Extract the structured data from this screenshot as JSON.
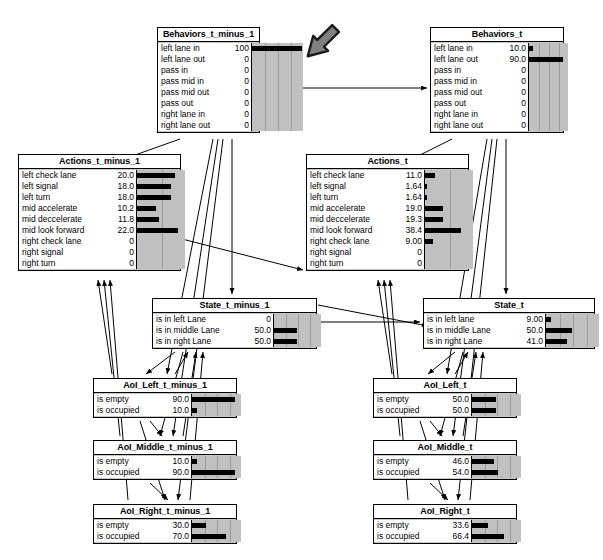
{
  "diagram": {
    "background": "#ffffff",
    "node_fill": "#ffffff",
    "bar_background": "#c0c0c0",
    "bar_color": "#000000",
    "edge_color": "#000000",
    "annotation_arrow_color": "#808080"
  },
  "nodes": [
    {
      "id": "behaviors_t_minus_1",
      "title": "Behaviors_t_minus_1",
      "x": 157,
      "y": 27,
      "w": 103,
      "h": 110,
      "label_w": 66,
      "value_w": 22,
      "bar_w": 52,
      "bar_max": 100,
      "grid_divisions": 4,
      "rows": [
        {
          "label": "left lane in",
          "value": "100",
          "pct": 100
        },
        {
          "label": "left lane out",
          "value": "0",
          "pct": 0
        },
        {
          "label": "pass in",
          "value": "0",
          "pct": 0
        },
        {
          "label": "pass mid in",
          "value": "0",
          "pct": 0
        },
        {
          "label": "pass mid out",
          "value": "0",
          "pct": 0
        },
        {
          "label": "pass out",
          "value": "0",
          "pct": 0
        },
        {
          "label": "right lane in",
          "value": "0",
          "pct": 0
        },
        {
          "label": "right lane out",
          "value": "0",
          "pct": 0
        }
      ]
    },
    {
      "id": "behaviors_t",
      "title": "Behaviors_t",
      "x": 430,
      "y": 27,
      "w": 134,
      "h": 110,
      "label_w": 66,
      "value_w": 26,
      "bar_w": 40,
      "bar_max": 100,
      "grid_divisions": 4,
      "rows": [
        {
          "label": "left lane in",
          "value": "10.0",
          "pct": 10
        },
        {
          "label": "left lane out",
          "value": "90.0",
          "pct": 90
        },
        {
          "label": "pass in",
          "value": "0",
          "pct": 0
        },
        {
          "label": "pass mid in",
          "value": "0",
          "pct": 0
        },
        {
          "label": "pass mid out",
          "value": "0",
          "pct": 0
        },
        {
          "label": "pass out",
          "value": "0",
          "pct": 0
        },
        {
          "label": "right lane in",
          "value": "0",
          "pct": 0
        },
        {
          "label": "right lane out",
          "value": "0",
          "pct": 0
        }
      ]
    },
    {
      "id": "actions_t_minus_1",
      "title": "Actions_t_minus_1",
      "x": 18,
      "y": 154,
      "w": 163,
      "h": 122,
      "label_w": 86,
      "value_w": 26,
      "bar_w": 49,
      "bar_max": 25,
      "grid_divisions": 2,
      "rows": [
        {
          "label": "left check lane",
          "value": "20.0",
          "pct": 20.0
        },
        {
          "label": "left signal",
          "value": "18.0",
          "pct": 18.0
        },
        {
          "label": "left turn",
          "value": "18.0",
          "pct": 18.0
        },
        {
          "label": "mid accelerate",
          "value": "10.2",
          "pct": 10.2
        },
        {
          "label": "mid deccelerate",
          "value": "11.8",
          "pct": 11.8
        },
        {
          "label": "mid look forward",
          "value": "22.0",
          "pct": 22.0
        },
        {
          "label": "right check lane",
          "value": "0",
          "pct": 0
        },
        {
          "label": "right signal",
          "value": "0",
          "pct": 0
        },
        {
          "label": "right turn",
          "value": "0",
          "pct": 0
        }
      ]
    },
    {
      "id": "actions_t",
      "title": "Actions_t",
      "x": 306,
      "y": 154,
      "w": 163,
      "h": 122,
      "label_w": 86,
      "value_w": 26,
      "bar_w": 49,
      "bar_max": 50,
      "grid_divisions": 2,
      "rows": [
        {
          "label": "left check lane",
          "value": "11.0",
          "pct": 11.0
        },
        {
          "label": "left signal",
          "value": "1.64",
          "pct": 1.64
        },
        {
          "label": "left turn",
          "value": "1.64",
          "pct": 1.64
        },
        {
          "label": "mid accelerate",
          "value": "19.0",
          "pct": 19.0
        },
        {
          "label": "mid deccelerate",
          "value": "19.3",
          "pct": 19.3
        },
        {
          "label": "mid look forward",
          "value": "38.4",
          "pct": 38.4
        },
        {
          "label": "right check lane",
          "value": "9.00",
          "pct": 9.0
        },
        {
          "label": "right signal",
          "value": "0",
          "pct": 0
        },
        {
          "label": "right turn",
          "value": "0",
          "pct": 0
        }
      ]
    },
    {
      "id": "state_t_minus_1",
      "title": "State_t_minus_1",
      "x": 152,
      "y": 298,
      "w": 165,
      "h": 52,
      "label_w": 88,
      "value_w": 27,
      "bar_w": 48,
      "bar_max": 100,
      "grid_divisions": 4,
      "rows": [
        {
          "label": "is in left Lane",
          "value": "0",
          "pct": 0
        },
        {
          "label": "is in middle Lane",
          "value": "50.0",
          "pct": 50
        },
        {
          "label": "is in right Lane",
          "value": "50.0",
          "pct": 50
        }
      ]
    },
    {
      "id": "state_t",
      "title": "State_t",
      "x": 423,
      "y": 298,
      "w": 172,
      "h": 52,
      "label_w": 88,
      "value_w": 28,
      "bar_w": 54,
      "bar_max": 100,
      "grid_divisions": 4,
      "rows": [
        {
          "label": "is in left lane",
          "value": "9.00",
          "pct": 9
        },
        {
          "label": "is in middle Lane",
          "value": "50.0",
          "pct": 50
        },
        {
          "label": "is in right Lane",
          "value": "41.0",
          "pct": 41
        }
      ]
    },
    {
      "id": "aoi_left_t_minus_1",
      "title": "AoI_Left_t_minus_1",
      "x": 93,
      "y": 378,
      "w": 144,
      "h": 41,
      "label_w": 64,
      "value_w": 28,
      "bar_w": 50,
      "bar_max": 100,
      "grid_divisions": 4,
      "rows": [
        {
          "label": "is empty",
          "value": "90.0",
          "pct": 90
        },
        {
          "label": "is occupied",
          "value": "10.0",
          "pct": 10
        }
      ]
    },
    {
      "id": "aoi_left_t",
      "title": "AoI_Left_t",
      "x": 373,
      "y": 378,
      "w": 144,
      "h": 41,
      "label_w": 64,
      "value_w": 28,
      "bar_w": 50,
      "bar_max": 100,
      "grid_divisions": 4,
      "rows": [
        {
          "label": "is empty",
          "value": "50.0",
          "pct": 50
        },
        {
          "label": "is occupied",
          "value": "50.0",
          "pct": 50
        }
      ]
    },
    {
      "id": "aoi_middle_t_minus_1",
      "title": "AoI_Middle_t_minus_1",
      "x": 93,
      "y": 440,
      "w": 144,
      "h": 41,
      "label_w": 64,
      "value_w": 28,
      "bar_w": 50,
      "bar_max": 100,
      "grid_divisions": 4,
      "rows": [
        {
          "label": "is empty",
          "value": "10.0",
          "pct": 10
        },
        {
          "label": "is occupied",
          "value": "90.0",
          "pct": 90
        }
      ]
    },
    {
      "id": "aoi_middle_t",
      "title": "AoI_Middle_t",
      "x": 373,
      "y": 440,
      "w": 144,
      "h": 41,
      "label_w": 64,
      "value_w": 28,
      "bar_w": 50,
      "bar_max": 100,
      "grid_divisions": 4,
      "rows": [
        {
          "label": "is empty",
          "value": "46.0",
          "pct": 46
        },
        {
          "label": "is occupied",
          "value": "54.0",
          "pct": 54
        }
      ]
    },
    {
      "id": "aoi_right_t_minus_1",
      "title": "AoI_Right_t_minus_1",
      "x": 93,
      "y": 504,
      "w": 144,
      "h": 41,
      "label_w": 64,
      "value_w": 28,
      "bar_w": 50,
      "bar_max": 100,
      "grid_divisions": 4,
      "rows": [
        {
          "label": "is empty",
          "value": "30.0",
          "pct": 30
        },
        {
          "label": "is occupied",
          "value": "70.0",
          "pct": 70
        }
      ]
    },
    {
      "id": "aoi_right_t",
      "title": "AoI_Right_t",
      "x": 373,
      "y": 504,
      "w": 144,
      "h": 41,
      "label_w": 64,
      "value_w": 28,
      "bar_w": 50,
      "bar_max": 100,
      "grid_divisions": 4,
      "rows": [
        {
          "label": "is empty",
          "value": "33.6",
          "pct": 33.6
        },
        {
          "label": "is occupied",
          "value": "66.4",
          "pct": 66.4
        }
      ]
    }
  ],
  "edges": [
    {
      "from": "behaviors_t_minus_1",
      "to": "behaviors_t",
      "path": "M262,88 L427,88"
    },
    {
      "from": "behaviors_t_minus_1",
      "to": "actions_t_minus_1",
      "path": "M180,139 L121,160"
    },
    {
      "from": "behaviors_t",
      "to": "actions_t",
      "path": "M452,139 L410,160"
    },
    {
      "from": "behaviors_t_minus_1",
      "to": "state_t_minus_1",
      "path": "M232,139 L232,294"
    },
    {
      "from": "behaviors_t_minus_1",
      "to": "aoi_left_t_minus_1",
      "path": "M213,139 L167,374"
    },
    {
      "from": "behaviors_t_minus_1",
      "to": "aoi_middle_t_minus_1",
      "path": "M218,139 L173,436"
    },
    {
      "from": "behaviors_t_minus_1",
      "to": "aoi_right_t_minus_1",
      "path": "M223,139 L178,500"
    },
    {
      "from": "behaviors_t",
      "to": "state_t",
      "path": "M506,139 L506,294"
    },
    {
      "from": "behaviors_t",
      "to": "aoi_left_t",
      "path": "M487,139 L447,374"
    },
    {
      "from": "behaviors_t",
      "to": "aoi_middle_t",
      "path": "M492,139 L453,436"
    },
    {
      "from": "behaviors_t",
      "to": "aoi_right_t",
      "path": "M497,139 L458,500"
    },
    {
      "from": "actions_t_minus_1",
      "to": "actions_t",
      "path": "M182,239 L303,270"
    },
    {
      "from": "state_t_minus_1",
      "to": "state_t",
      "path": "M318,322 L420,322"
    },
    {
      "from": "state_t_minus_1",
      "to": "aoi_left_t_minus_1",
      "path": "M175,352 L146,374"
    },
    {
      "from": "state_t_minus_1",
      "to": "aoi_middle_t_minus_1",
      "path": "M183,352 L160,436"
    },
    {
      "from": "state_t",
      "to": "aoi_left_t",
      "path": "M455,352 L428,374"
    },
    {
      "from": "state_t",
      "to": "aoi_middle_t",
      "path": "M463,352 L440,436"
    },
    {
      "from": "aoi_left_t_minus_1",
      "to": "aoi_middle_t_minus_1",
      "path": "M150,421 L162,436"
    },
    {
      "from": "aoi_left_t_minus_1",
      "to": "aoi_right_t_minus_1",
      "path": "M140,421 L165,500"
    },
    {
      "from": "aoi_middle_t_minus_1",
      "to": "aoi_right_t_minus_1",
      "path": "M150,483 L168,500"
    },
    {
      "from": "aoi_left_t",
      "to": "aoi_middle_t",
      "path": "M430,421 L442,436"
    },
    {
      "from": "aoi_left_t",
      "to": "aoi_right_t",
      "path": "M420,421 L445,500"
    },
    {
      "from": "aoi_middle_t",
      "to": "aoi_right_t",
      "path": "M430,483 L448,500"
    },
    {
      "from": "aoi_left_t_minus_1",
      "to": "actions_t_minus_1",
      "path": "M112,374 L98,280"
    },
    {
      "from": "aoi_middle_t_minus_1",
      "to": "actions_t_minus_1",
      "path": "M120,436 L104,280"
    },
    {
      "from": "aoi_right_t_minus_1",
      "to": "actions_t_minus_1",
      "path": "M128,500 L110,280"
    },
    {
      "from": "aoi_left_t_minus_1",
      "to": "state_t_minus_1",
      "path": "M175,374 L188,352"
    },
    {
      "from": "aoi_middle_t_minus_1",
      "to": "state_t_minus_1",
      "path": "M183,436 L196,352"
    },
    {
      "from": "aoi_right_t_minus_1",
      "to": "state_t_minus_1",
      "path": "M190,500 L203,352"
    },
    {
      "from": "aoi_left_t",
      "to": "actions_t",
      "path": "M392,374 L378,280"
    },
    {
      "from": "aoi_middle_t",
      "to": "actions_t",
      "path": "M400,436 L384,280"
    },
    {
      "from": "aoi_right_t",
      "to": "actions_t",
      "path": "M408,500 L390,280"
    },
    {
      "from": "aoi_left_t",
      "to": "state_t",
      "path": "M455,374 L468,352"
    },
    {
      "from": "aoi_middle_t",
      "to": "state_t",
      "path": "M463,436 L476,352"
    },
    {
      "from": "aoi_right_t",
      "to": "state_t",
      "path": "M470,500 L483,352"
    },
    {
      "from": "state_t_minus_1",
      "to": "aoi_left_t",
      "path": "M318,305 L428,326"
    }
  ],
  "annotation": {
    "arrow_label": "pointer-arrow",
    "x": 293,
    "y": 18,
    "w": 58,
    "h": 48,
    "rotation_deg": 225
  }
}
